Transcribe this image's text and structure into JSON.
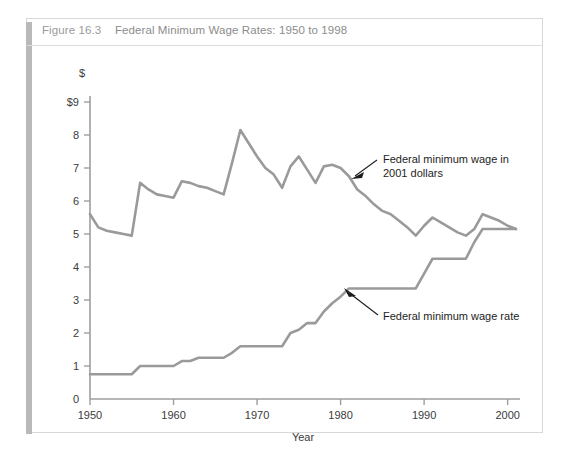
{
  "figure": {
    "number_label": "Figure 16.3",
    "title": "Federal Minimum Wage Rates: 1950 to 1998",
    "frame_color": "#d8d8d8",
    "spine_color": "#b9b9b9",
    "title_color": "#8c8c8c"
  },
  "annotations": {
    "real_line_1": "Federal minimum wage in",
    "real_line_2": "2001 dollars",
    "nominal_line_1": "Federal minimum wage rate"
  },
  "axes": {
    "y_unit_symbol": "$",
    "y_top_label": "$9",
    "y_ticks": [
      "$9",
      "8",
      "7",
      "6",
      "5",
      "4",
      "3",
      "2",
      "1",
      "0"
    ],
    "y_tick_values": [
      9,
      8,
      7,
      6,
      5,
      4,
      3,
      2,
      1,
      0
    ],
    "x_ticks": [
      "1950",
      "1960",
      "1970",
      "1980",
      "1990",
      "2000"
    ],
    "x_tick_values": [
      1950,
      1960,
      1970,
      1980,
      1990,
      2000
    ],
    "x_title": "Year"
  },
  "chart_data": {
    "type": "line",
    "title": "Federal Minimum Wage Rates: 1950 to 1998",
    "xlabel": "Year",
    "ylabel": "$",
    "xlim": [
      1950,
      2001
    ],
    "ylim": [
      0,
      9
    ],
    "grid": false,
    "legend_position": "inline-annotations",
    "line_color": "#9a9a9a",
    "line_width": 2.6,
    "series": [
      {
        "name": "Federal minimum wage in 2001 dollars",
        "annotation": "Federal minimum wage in 2001 dollars",
        "x": [
          1950,
          1951,
          1952,
          1953,
          1954,
          1955,
          1956,
          1957,
          1958,
          1959,
          1960,
          1961,
          1962,
          1963,
          1964,
          1965,
          1966,
          1967,
          1968,
          1969,
          1970,
          1971,
          1972,
          1973,
          1974,
          1975,
          1976,
          1977,
          1978,
          1979,
          1980,
          1981,
          1982,
          1983,
          1984,
          1985,
          1986,
          1987,
          1988,
          1989,
          1990,
          1991,
          1992,
          1993,
          1994,
          1995,
          1996,
          1997,
          1998,
          1999,
          2000,
          2001
        ],
        "values": [
          5.6,
          5.2,
          5.1,
          5.05,
          5.0,
          4.95,
          6.55,
          6.35,
          6.2,
          6.15,
          6.1,
          6.6,
          6.55,
          6.45,
          6.4,
          6.3,
          6.2,
          7.15,
          8.15,
          7.75,
          7.35,
          7.0,
          6.8,
          6.4,
          7.05,
          7.35,
          6.95,
          6.55,
          7.05,
          7.1,
          7.0,
          6.75,
          6.35,
          6.15,
          5.9,
          5.7,
          5.6,
          5.4,
          5.2,
          4.95,
          5.25,
          5.5,
          5.35,
          5.2,
          5.05,
          4.95,
          5.15,
          5.6,
          5.5,
          5.4,
          5.25,
          5.15
        ]
      },
      {
        "name": "Federal minimum wage rate",
        "annotation": "Federal minimum wage rate",
        "x": [
          1950,
          1951,
          1952,
          1953,
          1954,
          1955,
          1956,
          1957,
          1958,
          1959,
          1960,
          1961,
          1962,
          1963,
          1964,
          1965,
          1966,
          1967,
          1968,
          1969,
          1970,
          1971,
          1972,
          1973,
          1974,
          1975,
          1976,
          1977,
          1978,
          1979,
          1980,
          1981,
          1982,
          1983,
          1984,
          1985,
          1986,
          1987,
          1988,
          1989,
          1990,
          1991,
          1992,
          1993,
          1994,
          1995,
          1996,
          1997,
          1998,
          1999,
          2000,
          2001
        ],
        "values": [
          0.75,
          0.75,
          0.75,
          0.75,
          0.75,
          0.75,
          1.0,
          1.0,
          1.0,
          1.0,
          1.0,
          1.15,
          1.15,
          1.25,
          1.25,
          1.25,
          1.25,
          1.4,
          1.6,
          1.6,
          1.6,
          1.6,
          1.6,
          1.6,
          2.0,
          2.1,
          2.3,
          2.3,
          2.65,
          2.9,
          3.1,
          3.35,
          3.35,
          3.35,
          3.35,
          3.35,
          3.35,
          3.35,
          3.35,
          3.35,
          3.8,
          4.25,
          4.25,
          4.25,
          4.25,
          4.25,
          4.75,
          5.15,
          5.15,
          5.15,
          5.15,
          5.15
        ]
      }
    ]
  }
}
